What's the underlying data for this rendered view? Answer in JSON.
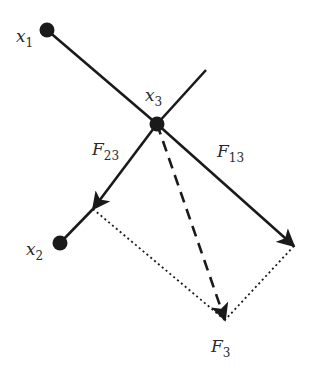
{
  "diagram": {
    "colors": {
      "stroke": "#1a1a1a",
      "label": "#2a2a2a",
      "background": "#ffffff"
    },
    "points": {
      "x1": {
        "label": "x",
        "sub": "1"
      },
      "x2": {
        "label": "x",
        "sub": "2"
      },
      "x3": {
        "label": "x",
        "sub": "3"
      }
    },
    "forces": {
      "F23": {
        "label": "F",
        "sub": "23"
      },
      "F13": {
        "label": "F",
        "sub": "13"
      },
      "F3": {
        "label": "F",
        "sub": "3"
      }
    }
  }
}
